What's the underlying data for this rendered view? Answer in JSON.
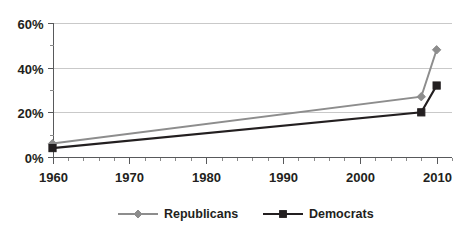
{
  "chart_data": {
    "type": "line",
    "title": "",
    "subtitle": "",
    "xlabel": "",
    "ylabel": "",
    "xlim": [
      1960,
      2012
    ],
    "ylim": [
      0,
      60
    ],
    "grid": true,
    "legend_position": "bottom",
    "x_tick_labels": [
      "1960",
      "1970",
      "1980",
      "1990",
      "2000",
      "2010"
    ],
    "x_ticks": [
      1960,
      1970,
      1980,
      1990,
      2000,
      2010
    ],
    "y_tick_labels": [
      "0%",
      "20%",
      "40%",
      "60%"
    ],
    "y_ticks": [
      0,
      20,
      40,
      60
    ],
    "y_minor_ticks": [
      10,
      30,
      50
    ],
    "x": [
      1960,
      2008,
      2010
    ],
    "series": [
      {
        "name": "Republicans",
        "color": "#8d8d8d",
        "marker": "diamond",
        "values": [
          6,
          27,
          48
        ]
      },
      {
        "name": "Democrats",
        "color": "#231f20",
        "marker": "square",
        "values": [
          4,
          20,
          32
        ]
      }
    ]
  },
  "legend": {
    "items": [
      {
        "label": "Republicans",
        "color": "#8d8d8d",
        "marker": "diamond"
      },
      {
        "label": "Democrats",
        "color": "#231f20",
        "marker": "square"
      }
    ]
  }
}
